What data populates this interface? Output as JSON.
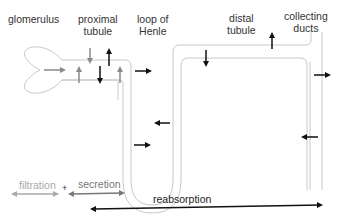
{
  "labels": {
    "glomerulus": "glomerulus",
    "proximal_line1": "proximal",
    "proximal_line2": "tubule",
    "loop_line1": "loop of",
    "loop_line2": "Henle",
    "distal_line1": "distal",
    "distal_line2": "tubule",
    "collecting_line1": "collecting",
    "collecting_line2": "ducts"
  },
  "legend": {
    "filtration": "filtration",
    "plus": "+",
    "secretion": "secretion",
    "reabsorption": "reabsorption"
  },
  "colors": {
    "tube": "#c8c8c8",
    "arrow_dark": "#111111",
    "arrow_gray": "#8a8a8a",
    "filtration": "#aaaaaa",
    "secretion": "#777777",
    "reabsorption": "#111111"
  }
}
